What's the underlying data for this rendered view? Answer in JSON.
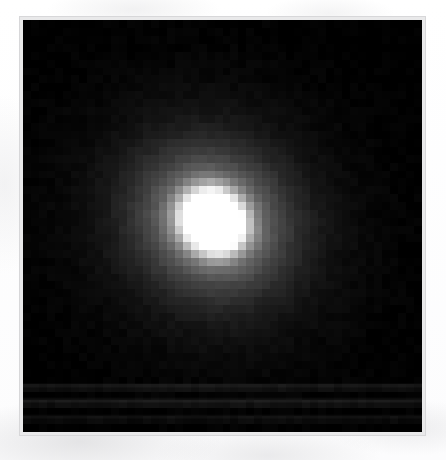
{
  "figure": {
    "kind": "astronomical-image",
    "alt_text": "Bright blob centered slightly above middle of a black square frame",
    "background_color": "#000000",
    "paper_color": "#fdfdfd",
    "frame_border_color": "#e9e9ea",
    "source_color_low": "#000000",
    "source_color_high": "#ffffff"
  },
  "plate": {
    "left_px": 20,
    "top_px": 17,
    "width_px": 405,
    "height_px": 418,
    "border_px": 3
  },
  "chart_data": {
    "type": "heatmap",
    "title": "",
    "subtitle": "",
    "xlabel": "",
    "ylabel": "",
    "legend": [],
    "annotations": [],
    "grid": false,
    "colormap": "grayscale",
    "vmin": 0,
    "vmax": 255,
    "nx": 50,
    "ny": 52,
    "x": [
      0,
      50
    ],
    "y": [
      0,
      52
    ],
    "xlim": [
      0,
      50
    ],
    "ylim": [
      0,
      52
    ],
    "source": {
      "peak_value": 255,
      "peak_col": 25,
      "peak_row": 24,
      "core_radius_cols": 4.0,
      "halo_radius_cols": 10.5,
      "elongation": 1.12,
      "position_angle_deg": 35,
      "core_offset_col": -1.2,
      "core_offset_row": 1.4
    },
    "streaks": [
      {
        "row": 46,
        "value": 12
      },
      {
        "row": 48,
        "value": 14
      },
      {
        "row": 50,
        "value": 9
      }
    ],
    "values_note": "Grayscale intensity field rendered procedurally from the source parameters above"
  }
}
